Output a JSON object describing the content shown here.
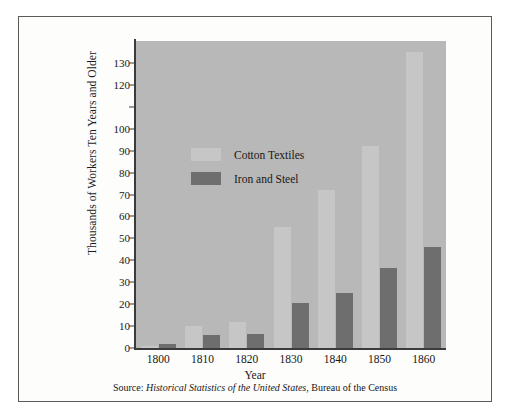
{
  "chart_data": {
    "type": "bar",
    "title": "",
    "xlabel": "Year",
    "ylabel": "Thousands of Workers Ten Years and Older",
    "categories": [
      "1800",
      "1810",
      "1820",
      "1830",
      "1840",
      "1850",
      "1860"
    ],
    "series": [
      {
        "name": "Cotton Textiles",
        "color": "#c6c6c6",
        "values": [
          1,
          10,
          12,
          55,
          72,
          92,
          135
        ]
      },
      {
        "name": "Iron and Steel",
        "color": "#6e6e6e",
        "values": [
          2,
          6,
          6.5,
          20.5,
          25,
          36.5,
          46
        ]
      }
    ],
    "ylim": [
      0,
      140
    ],
    "y_tick_values": [
      0,
      10,
      20,
      30,
      40,
      50,
      60,
      70,
      80,
      90,
      100,
      110,
      120,
      130
    ],
    "y_tick_labels": [
      "0",
      "10",
      "20",
      "30",
      "40",
      "50",
      "60",
      "70",
      "80",
      "90",
      "100",
      "",
      "120",
      "130"
    ],
    "grid": false,
    "legend_position": "inside-upper-left",
    "plot_background": "#b8b8b8",
    "page_background": "#fdfdfb"
  },
  "caption": {
    "prefix": "Source: ",
    "italic_title": "Historical Statistics of the United States",
    "suffix": ", Bureau of the Census"
  }
}
